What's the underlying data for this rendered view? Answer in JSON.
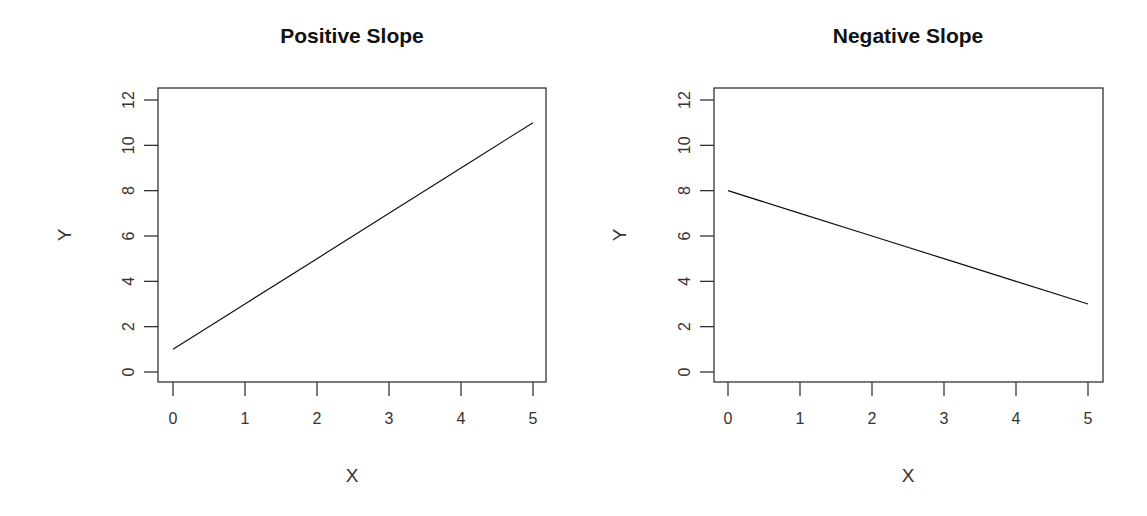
{
  "chart_data": [
    {
      "type": "line",
      "title": "Positive Slope",
      "xlabel": "X",
      "ylabel": "Y",
      "x": [
        0,
        1,
        2,
        3,
        4,
        5
      ],
      "series": [
        {
          "name": "y = 2x + 1",
          "values": [
            1,
            3,
            5,
            7,
            9,
            11
          ]
        }
      ],
      "xticks": [
        0,
        1,
        2,
        3,
        4,
        5
      ],
      "yticks": [
        0,
        2,
        4,
        6,
        8,
        10,
        12
      ],
      "xlim": [
        0,
        5
      ],
      "ylim": [
        0,
        12
      ],
      "grid": false,
      "legend": null
    },
    {
      "type": "line",
      "title": "Negative Slope",
      "xlabel": "X",
      "ylabel": "Y",
      "x": [
        0,
        1,
        2,
        3,
        4,
        5
      ],
      "series": [
        {
          "name": "y = 8 - x",
          "values": [
            8,
            7,
            6,
            5,
            4,
            3
          ]
        }
      ],
      "xticks": [
        0,
        1,
        2,
        3,
        4,
        5
      ],
      "yticks": [
        0,
        2,
        4,
        6,
        8,
        10,
        12
      ],
      "xlim": [
        0,
        5
      ],
      "ylim": [
        0,
        12
      ],
      "grid": false,
      "legend": null
    }
  ],
  "colors": {
    "line": "#111111",
    "axis": "#333333",
    "background": "#ffffff"
  }
}
